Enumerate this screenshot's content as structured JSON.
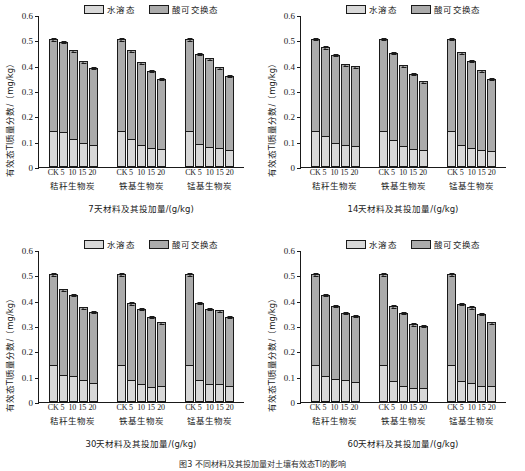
{
  "figure": {
    "caption": "图3 不同材料及其投加量对土壤有效态Tl的影响",
    "legend": [
      {
        "key": "water",
        "label": "水溶态",
        "color": "#d8d8d8"
      },
      {
        "key": "acid",
        "label": "酸可交换态",
        "color": "#ababab"
      }
    ],
    "axis": {
      "ylabel": "有效态Tl质量分数/（mg/kg）",
      "yticks": [
        "0",
        "0.1",
        "0.2",
        "0.3",
        "0.4",
        "0.5",
        "0.6"
      ],
      "ymin": 0,
      "ymax": 0.6,
      "xticks": [
        "CK",
        "5",
        "10",
        "15",
        "20"
      ],
      "groups": [
        "秸秆生物炭",
        "铁基生物炭",
        "锰基生物炭"
      ]
    }
  },
  "chart_data": [
    {
      "type": "bar",
      "id": "panel-7d",
      "title": "",
      "xlabel": "7天材料及其投加量/(g/kg)",
      "ylabel": "有效态Tl质量分数/（mg/kg）",
      "ylim": [
        0,
        0.6
      ],
      "grid": false,
      "legend_position": "top",
      "categories": [
        "CK",
        "5",
        "10",
        "15",
        "20"
      ],
      "groups": [
        "秸秆生物炭",
        "铁基生物炭",
        "锰基生物炭"
      ],
      "stacked": true,
      "series": [
        {
          "name": "水溶态",
          "values": [
            [
              0.143,
              0.138,
              0.11,
              0.093,
              0.088
            ],
            [
              0.143,
              0.111,
              0.088,
              0.077,
              0.072
            ],
            [
              0.143,
              0.091,
              0.08,
              0.075,
              0.067
            ]
          ]
        },
        {
          "name": "酸可交换态",
          "values": [
            [
              0.362,
              0.357,
              0.35,
              0.325,
              0.303
            ],
            [
              0.362,
              0.349,
              0.326,
              0.303,
              0.276
            ],
            [
              0.362,
              0.356,
              0.35,
              0.319,
              0.293
            ]
          ]
        }
      ],
      "totals": [
        [
          0.505,
          0.495,
          0.46,
          0.418,
          0.391
        ],
        [
          0.505,
          0.46,
          0.414,
          0.38,
          0.348
        ],
        [
          0.505,
          0.447,
          0.43,
          0.394,
          0.36
        ]
      ],
      "errors": [
        [
          0.008,
          0.006,
          0.006,
          0.006,
          0.005
        ],
        [
          0.008,
          0.007,
          0.006,
          0.005,
          0.006
        ],
        [
          0.008,
          0.006,
          0.006,
          0.006,
          0.005
        ]
      ]
    },
    {
      "type": "bar",
      "id": "panel-14d",
      "title": "",
      "xlabel": "14天材料及其投加量/(g/kg)",
      "ylabel": "有效态Tl质量分数/（mg/kg）",
      "ylim": [
        0,
        0.6
      ],
      "grid": false,
      "legend_position": "top",
      "categories": [
        "CK",
        "5",
        "10",
        "15",
        "20"
      ],
      "groups": [
        "秸秆生物炭",
        "铁基生物炭",
        "锰基生物炭"
      ],
      "stacked": true,
      "series": [
        {
          "name": "水溶态",
          "values": [
            [
              0.144,
              0.121,
              0.093,
              0.088,
              0.082
            ],
            [
              0.144,
              0.105,
              0.084,
              0.073,
              0.067
            ],
            [
              0.144,
              0.086,
              0.074,
              0.069,
              0.062
            ]
          ]
        },
        {
          "name": "酸可交换态",
          "values": [
            [
              0.363,
              0.352,
              0.351,
              0.318,
              0.315
            ],
            [
              0.363,
              0.347,
              0.318,
              0.296,
              0.271
            ],
            [
              0.363,
              0.367,
              0.345,
              0.313,
              0.287
            ]
          ]
        }
      ],
      "totals": [
        [
          0.507,
          0.473,
          0.444,
          0.406,
          0.397
        ],
        [
          0.507,
          0.452,
          0.402,
          0.369,
          0.338
        ],
        [
          0.507,
          0.453,
          0.419,
          0.382,
          0.349
        ]
      ],
      "errors": [
        [
          0.007,
          0.007,
          0.006,
          0.006,
          0.006
        ],
        [
          0.007,
          0.007,
          0.005,
          0.007,
          0.007
        ],
        [
          0.007,
          0.006,
          0.006,
          0.006,
          0.006
        ]
      ]
    },
    {
      "type": "bar",
      "id": "panel-30d",
      "title": "",
      "xlabel": "30天材料及其投加量/(g/kg)",
      "ylabel": "有效态Tl质量分数/（mg/kg）",
      "ylim": [
        0,
        0.6
      ],
      "grid": false,
      "legend_position": "top",
      "categories": [
        "CK",
        "5",
        "10",
        "15",
        "20"
      ],
      "groups": [
        "秸秆生物炭",
        "铁基生物炭",
        "锰基生物炭"
      ],
      "stacked": true,
      "series": [
        {
          "name": "水溶态",
          "values": [
            [
              0.145,
              0.105,
              0.101,
              0.085,
              0.077
            ],
            [
              0.145,
              0.086,
              0.073,
              0.061,
              0.062
            ],
            [
              0.145,
              0.086,
              0.073,
              0.071,
              0.062
            ]
          ]
        },
        {
          "name": "酸可交换态",
          "values": [
            [
              0.36,
              0.34,
              0.322,
              0.289,
              0.28
            ],
            [
              0.36,
              0.305,
              0.296,
              0.275,
              0.252
            ],
            [
              0.36,
              0.306,
              0.296,
              0.292,
              0.275
            ]
          ]
        }
      ],
      "totals": [
        [
          0.505,
          0.445,
          0.423,
          0.374,
          0.357
        ],
        [
          0.505,
          0.391,
          0.369,
          0.336,
          0.314
        ],
        [
          0.505,
          0.392,
          0.369,
          0.363,
          0.337
        ]
      ],
      "errors": [
        [
          0.007,
          0.006,
          0.005,
          0.006,
          0.005
        ],
        [
          0.007,
          0.008,
          0.006,
          0.006,
          0.005
        ],
        [
          0.007,
          0.007,
          0.006,
          0.005,
          0.006
        ]
      ]
    },
    {
      "type": "bar",
      "id": "panel-60d",
      "title": "",
      "xlabel": "60天材料及其投加量/(g/kg)",
      "ylabel": "有效态Tl质量分数/（mg/kg）",
      "ylim": [
        0,
        0.6
      ],
      "grid": false,
      "legend_position": "top",
      "categories": [
        "CK",
        "5",
        "10",
        "15",
        "20"
      ],
      "groups": [
        "秸秆生物炭",
        "铁基生物炭",
        "锰基生物炭"
      ],
      "stacked": true,
      "series": [
        {
          "name": "水溶态",
          "values": [
            [
              0.146,
              0.101,
              0.092,
              0.087,
              0.08
            ],
            [
              0.146,
              0.081,
              0.063,
              0.057,
              0.057
            ],
            [
              0.146,
              0.082,
              0.075,
              0.063,
              0.064
            ]
          ]
        },
        {
          "name": "酸可交换态",
          "values": [
            [
              0.359,
              0.323,
              0.288,
              0.266,
              0.26
            ],
            [
              0.359,
              0.298,
              0.29,
              0.251,
              0.245
            ],
            [
              0.359,
              0.306,
              0.3,
              0.286,
              0.251
            ]
          ]
        }
      ],
      "totals": [
        [
          0.505,
          0.424,
          0.38,
          0.353,
          0.34
        ],
        [
          0.505,
          0.379,
          0.353,
          0.308,
          0.302
        ],
        [
          0.505,
          0.388,
          0.375,
          0.349,
          0.315
        ]
      ],
      "errors": [
        [
          0.007,
          0.006,
          0.006,
          0.006,
          0.004
        ],
        [
          0.007,
          0.007,
          0.006,
          0.006,
          0.005
        ],
        [
          0.007,
          0.006,
          0.006,
          0.006,
          0.006
        ]
      ]
    }
  ]
}
